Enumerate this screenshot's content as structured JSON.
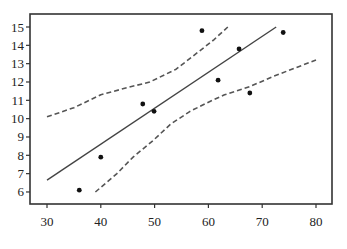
{
  "chart_data": {
    "type": "scatter",
    "title": "",
    "xlabel": "",
    "ylabel": "",
    "xlim": [
      30,
      80
    ],
    "ylim": [
      5.35,
      15.7
    ],
    "grid": false,
    "legend": null,
    "x_ticks": [
      30,
      40,
      50,
      60,
      70,
      80
    ],
    "y_ticks": [
      6,
      7,
      8,
      9,
      10,
      11,
      12,
      13,
      14,
      15
    ],
    "points": [
      {
        "x": 36,
        "y": 6.1
      },
      {
        "x": 40,
        "y": 7.9
      },
      {
        "x": 47.8,
        "y": 10.8
      },
      {
        "x": 49.9,
        "y": 10.4
      },
      {
        "x": 58.8,
        "y": 14.8
      },
      {
        "x": 61.8,
        "y": 12.1
      },
      {
        "x": 65.7,
        "y": 13.8
      },
      {
        "x": 67.7,
        "y": 11.4
      },
      {
        "x": 73.9,
        "y": 14.7
      }
    ],
    "series": [
      {
        "name": "regression-line",
        "style": "solid",
        "x": [
          30,
          72.6
        ],
        "y": [
          6.65,
          15.0
        ]
      },
      {
        "name": "upper-confidence-band",
        "style": "dashed",
        "x": [
          30,
          35,
          40,
          45,
          49.1,
          54,
          58.4,
          61,
          63.6
        ],
        "y": [
          10.1,
          10.6,
          11.3,
          11.7,
          12.0,
          12.7,
          13.7,
          14.3,
          15.0
        ]
      },
      {
        "name": "lower-confidence-band",
        "style": "dashed",
        "x": [
          39,
          43,
          46,
          49.7,
          53,
          56.6,
          60,
          63,
          67.7,
          72,
          76,
          80
        ],
        "y": [
          6.0,
          7.0,
          7.9,
          8.8,
          9.7,
          10.4,
          10.9,
          11.3,
          11.75,
          12.3,
          12.75,
          13.2
        ]
      }
    ]
  },
  "colors": {
    "axis": "#333333",
    "regression": "#444444",
    "band": "#555555",
    "point": "#111111",
    "background": "#ffffff"
  }
}
